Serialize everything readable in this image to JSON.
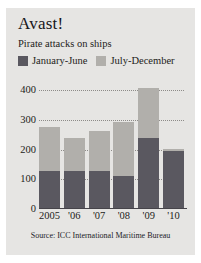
{
  "figure": {
    "title": "Avast!",
    "subtitle": "Pirate attacks on ships",
    "source": "Source: ICC International Maritime Bureau",
    "background_color": "#e6e5e3"
  },
  "colors": {
    "series_1": "#5a5860",
    "series_2": "#b1afab",
    "axis": "#46444a",
    "gridline": "#8d8b88",
    "text": "#1d1c20"
  },
  "chart_data": {
    "type": "bar",
    "title": "Avast!",
    "subtitle": "Pirate attacks on ships",
    "xlabel": "",
    "ylabel": "",
    "stacked": true,
    "grid": true,
    "legend_position": "top",
    "ylim": [
      0,
      400
    ],
    "yticks": [
      0,
      100,
      200,
      300,
      400
    ],
    "ytick_labels": [
      "0",
      "100",
      "200",
      "300",
      "400"
    ],
    "categories": [
      "2005",
      "'06",
      "'07",
      "'08",
      "'09",
      "'10"
    ],
    "series": [
      {
        "name": "January-June",
        "color": "#5a5860",
        "values": [
          127,
          127,
          127,
          111,
          240,
          196
        ]
      },
      {
        "name": "July-December",
        "color": "#b1afab",
        "values": [
          149,
          112,
          136,
          182,
          166,
          6
        ]
      }
    ],
    "totals": [
      276,
      239,
      263,
      293,
      406,
      202
    ],
    "source": "Source: ICC International Maritime Bureau"
  }
}
